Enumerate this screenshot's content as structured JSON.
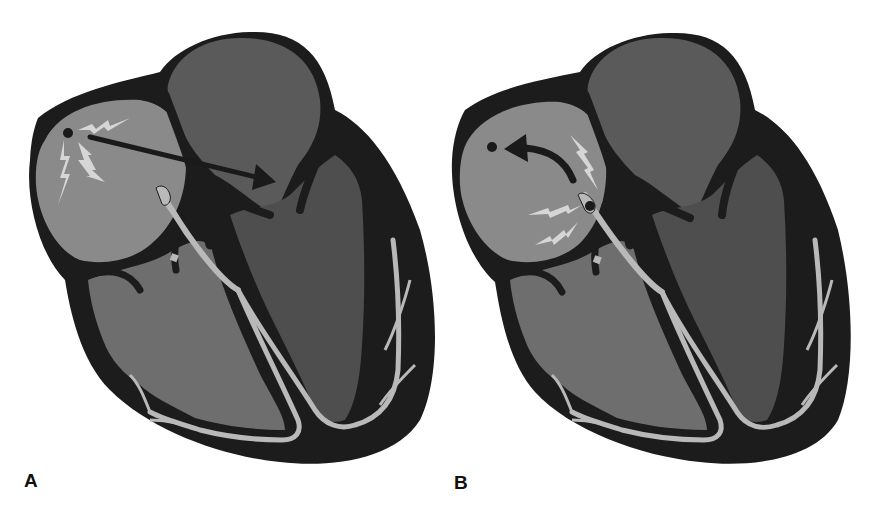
{
  "figure": {
    "colors": {
      "outline": "#1c1c1c",
      "right_atrium": "#8a8a8a",
      "left_atrium": "#5a5a5a",
      "right_ventricle": "#6e6e6e",
      "left_ventricle": "#4e4e4e",
      "conduction_fibers": "#b9b9b9",
      "impulse_sparks": "#d6d6d6",
      "arrow": "#1a1a1a"
    },
    "panels": [
      {
        "label": "A",
        "description": "Impulse originates at the SA node (dot in upper right atrium) and spreads forward across the atria toward the left atrium (straight arrow).",
        "impulse_origin": "SA node",
        "arrow_direction": "forward (right atrium to left atrium)"
      },
      {
        "label": "B",
        "description": "Impulse originates at the AV junction (dot at top of bundle of His) and travels backward/upward into the atria (curved retrograde arrow toward SA node region).",
        "impulse_origin": "AV junction",
        "arrow_direction": "retrograde (AV junction to SA node region)"
      }
    ]
  }
}
